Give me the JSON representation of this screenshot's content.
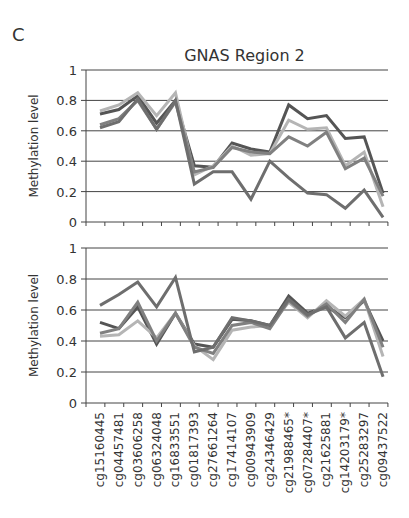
{
  "panel_letter": "C",
  "title": "GNAS Region 2",
  "chart_data": [
    {
      "type": "line",
      "title": "GNAS Region 2",
      "xlabel": "",
      "ylabel": "Methylation level",
      "ylim": [
        0,
        1
      ],
      "yticks": [
        0,
        0.2,
        0.4,
        0.6,
        0.8,
        1
      ],
      "grid": true,
      "categories": [
        "cg15160445",
        "cg04457481",
        "cg03606258",
        "cg06324048",
        "cg16833551",
        "cg01817393",
        "cg27661264",
        "cg17414107",
        "cg00943909",
        "cg24346429",
        "cg21988465*",
        "cg07284407*",
        "cg21625881",
        "cg14203179*",
        "cg25283297",
        "cg09437522"
      ],
      "series": [
        {
          "name": "Series 1",
          "color": "#555555",
          "values": [
            0.71,
            0.74,
            0.83,
            0.65,
            0.8,
            0.37,
            0.36,
            0.52,
            0.48,
            0.46,
            0.77,
            0.68,
            0.7,
            0.55,
            0.56,
            0.19
          ]
        },
        {
          "name": "Series 2",
          "color": "#b5b5b5",
          "values": [
            0.73,
            0.77,
            0.85,
            0.7,
            0.85,
            0.31,
            0.37,
            0.5,
            0.44,
            0.45,
            0.67,
            0.61,
            0.62,
            0.37,
            0.46,
            0.1
          ]
        },
        {
          "name": "Series 3",
          "color": "#808080",
          "values": [
            0.64,
            0.68,
            0.8,
            0.61,
            0.79,
            0.33,
            0.36,
            0.49,
            0.46,
            0.45,
            0.56,
            0.5,
            0.59,
            0.35,
            0.42,
            0.17
          ]
        },
        {
          "name": "Series 4",
          "color": "#6e6e6e",
          "values": [
            0.62,
            0.66,
            0.81,
            0.61,
            0.8,
            0.25,
            0.33,
            0.33,
            0.15,
            0.4,
            0.29,
            0.19,
            0.18,
            0.09,
            0.21,
            0.03
          ]
        }
      ]
    },
    {
      "type": "line",
      "title": "",
      "xlabel": "",
      "ylabel": "Methylation level",
      "ylim": [
        0,
        1
      ],
      "yticks": [
        0,
        0.2,
        0.4,
        0.6,
        0.8,
        1
      ],
      "grid": true,
      "categories": [
        "cg15160445",
        "cg04457481",
        "cg03606258",
        "cg06324048",
        "cg16833551",
        "cg01817393",
        "cg27661264",
        "cg17414107",
        "cg00943909",
        "cg24346429",
        "cg21988465*",
        "cg07284407*",
        "cg21625881",
        "cg14203179*",
        "cg25283297",
        "cg09437522"
      ],
      "series": [
        {
          "name": "Series 1",
          "color": "#555555",
          "values": [
            0.52,
            0.48,
            0.62,
            0.38,
            0.58,
            0.38,
            0.36,
            0.54,
            0.53,
            0.5,
            0.69,
            0.58,
            0.62,
            0.55,
            0.66,
            0.4
          ]
        },
        {
          "name": "Series 2",
          "color": "#b5b5b5",
          "values": [
            0.43,
            0.44,
            0.53,
            0.42,
            0.58,
            0.37,
            0.28,
            0.47,
            0.49,
            0.5,
            0.65,
            0.55,
            0.66,
            0.56,
            0.67,
            0.3
          ]
        },
        {
          "name": "Series 3",
          "color": "#808080",
          "values": [
            0.45,
            0.48,
            0.65,
            0.4,
            0.58,
            0.36,
            0.32,
            0.5,
            0.52,
            0.48,
            0.66,
            0.56,
            0.64,
            0.52,
            0.67,
            0.36
          ]
        },
        {
          "name": "Series 4",
          "color": "#6e6e6e",
          "values": [
            0.63,
            0.7,
            0.78,
            0.62,
            0.81,
            0.33,
            0.36,
            0.55,
            0.53,
            0.5,
            0.67,
            0.57,
            0.62,
            0.42,
            0.52,
            0.17
          ]
        }
      ]
    }
  ]
}
